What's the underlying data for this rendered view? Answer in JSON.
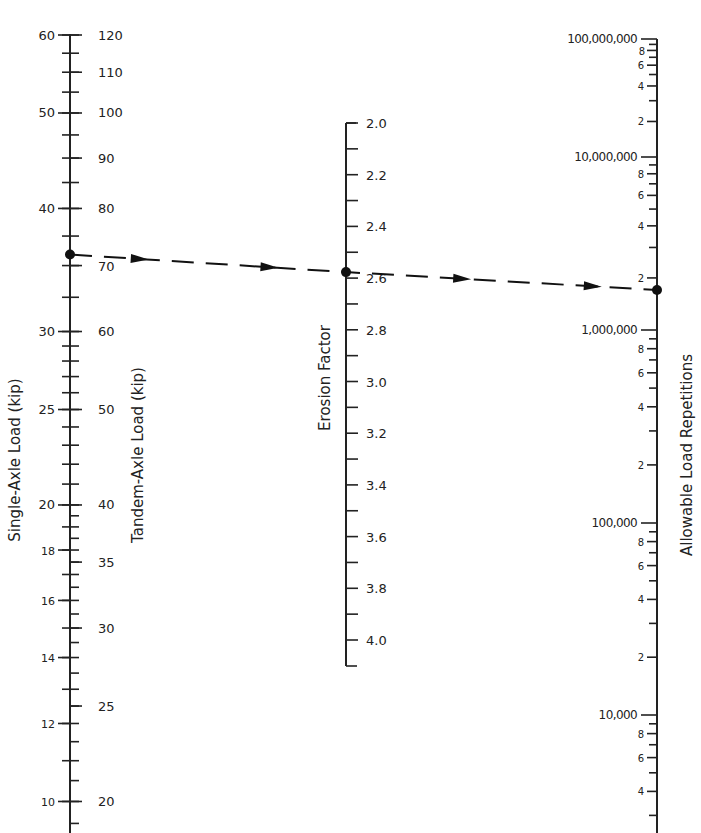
{
  "chart_data": {
    "type": "nomograph",
    "title": "",
    "axes": [
      {
        "name": "Single-Axle Load (kip)",
        "scale": "log",
        "x": 70,
        "major_labels": [
          60,
          50,
          40,
          30,
          25,
          20,
          18,
          16,
          14,
          12,
          10
        ],
        "label_side": "left"
      },
      {
        "name": "Tandem-Axle Load (kip)",
        "scale": "log",
        "x": 70,
        "major_labels": [
          120,
          110,
          100,
          90,
          80,
          70,
          60,
          50,
          40,
          35,
          30,
          25,
          20
        ],
        "label_side": "right"
      },
      {
        "name": "Erosion Factor",
        "scale": "linear",
        "x": 346,
        "range": [
          2.0,
          4.1
        ],
        "major_labels": [
          "2.0",
          "2.2",
          "2.4",
          "2.6",
          "2.8",
          "3.0",
          "3.2",
          "3.4",
          "3.6",
          "3.8",
          "4.0"
        ],
        "label_side": "right"
      },
      {
        "name": "Allowable Load Repetitions",
        "scale": "log",
        "x": 657,
        "decade_labels": [
          "100,000,000",
          "10,000,000",
          "1,000,000",
          "100,000",
          "10,000"
        ],
        "minor_labels": [
          "8",
          "6",
          "4",
          "2"
        ],
        "label_side": "left"
      }
    ],
    "example_path": {
      "single_axle_load_kip": 35,
      "tandem_axle_load_kip": 70,
      "erosion_factor": 2.6,
      "allowable_load_repetitions": 1600000,
      "line_style": "dashed with arrows"
    }
  },
  "labels": {
    "single_axis_title": "Single-Axle Load (kip)",
    "tandem_axis_title": "Tandem-Axle Load (kip)",
    "erosion_axis_title": "Erosion Factor",
    "reps_axis_title": "Allowable Load Repetitions"
  }
}
